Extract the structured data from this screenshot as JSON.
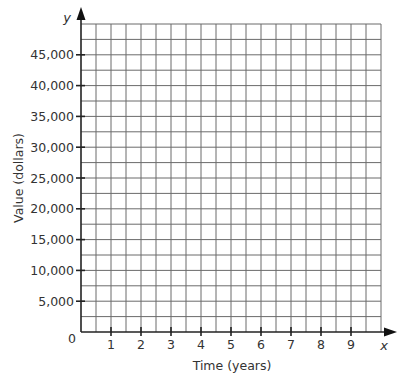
{
  "chart_data": {
    "type": "line",
    "title": "",
    "xlabel": "Time (years)",
    "ylabel": "Value (dollars)",
    "x_axis_var": "x",
    "y_axis_var": "y",
    "origin_label": "0",
    "x_ticks": [
      1,
      2,
      3,
      4,
      5,
      6,
      7,
      8,
      9
    ],
    "x_tick_labels": [
      "1",
      "2",
      "3",
      "4",
      "5",
      "6",
      "7",
      "8",
      "9"
    ],
    "y_ticks": [
      5000,
      10000,
      15000,
      20000,
      25000,
      30000,
      35000,
      40000,
      45000
    ],
    "y_tick_labels": [
      "5,000",
      "10,000",
      "15,000",
      "20,000",
      "25,000",
      "30,000",
      "35,000",
      "40,000",
      "45,000"
    ],
    "xlim": [
      0,
      10
    ],
    "ylim": [
      0,
      50000
    ],
    "grid": true,
    "grid_minor_x": 0.5,
    "grid_minor_y": 2500,
    "series": [],
    "legend": null
  }
}
